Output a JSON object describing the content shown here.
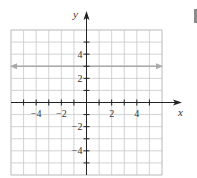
{
  "chart_data": {
    "type": "line",
    "title": "",
    "xlabel": "x",
    "ylabel": "y",
    "xlim": [
      -6,
      6
    ],
    "ylim": [
      -6,
      6
    ],
    "grid": true,
    "x_ticks": [
      -4,
      -2,
      2,
      4
    ],
    "y_ticks": [
      4,
      2,
      -2,
      -4
    ],
    "x_tick_labels": [
      "−4",
      "−2",
      "2",
      "4"
    ],
    "y_tick_labels": [
      "4",
      "2",
      "−2",
      "−4"
    ],
    "series": [
      {
        "name": "y = 3",
        "x": [
          -6,
          6
        ],
        "y": [
          3,
          3
        ],
        "color": "#a9a9a9",
        "arrows_both_ends": true
      }
    ],
    "axis_color": "#222222",
    "grid_color": "#c8c8c8"
  }
}
